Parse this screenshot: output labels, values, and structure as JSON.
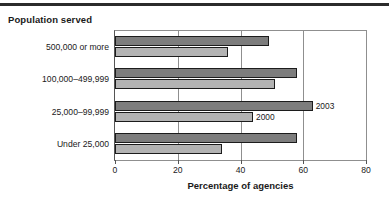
{
  "figure": {
    "group_title": "Population served",
    "x_axis_title": "Percentage of agencies",
    "rule": "horizontal-rule"
  },
  "annotations": [
    {
      "text": "2003",
      "series": "2003",
      "category": "25,000–99,999"
    },
    {
      "text": "2000",
      "series": "2000",
      "category": "25,000–99,999"
    }
  ],
  "chart_data": {
    "type": "bar",
    "orientation": "horizontal",
    "title": "Population served",
    "xlabel": "Percentage of agencies",
    "ylabel": "Population served",
    "xlim": [
      0,
      80
    ],
    "xticks": [
      0,
      20,
      40,
      60,
      80
    ],
    "xtick_labels": [
      "0",
      "20",
      "40",
      "60",
      "80"
    ],
    "grid": "vertical",
    "legend": "inline-annotation",
    "categories": [
      "500,000 or more",
      "100,000–499,999",
      "25,000–99,999",
      "Under 25,000"
    ],
    "series": [
      {
        "name": "2003",
        "color": "#7d7d7d",
        "values": [
          49,
          58,
          63,
          58
        ]
      },
      {
        "name": "2000",
        "color": "#b3b3b3",
        "values": [
          36,
          51,
          44,
          34
        ]
      }
    ]
  }
}
